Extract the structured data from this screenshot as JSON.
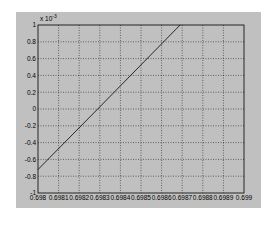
{
  "chart_data": {
    "type": "line",
    "title": "",
    "xlabel": "",
    "ylabel": "",
    "y_scale_label": "x 10^-3",
    "y_multiplier": 0.001,
    "xlim": [
      0.698,
      0.699
    ],
    "ylim": [
      -1,
      1
    ],
    "grid": true,
    "legend": null,
    "x_ticks": [
      "0.698",
      "0.6981",
      "0.6982",
      "0.6983",
      "0.6984",
      "0.6985",
      "0.6986",
      "0.6987",
      "0.6988",
      "0.6989",
      "0.699"
    ],
    "y_ticks": [
      "-1",
      "-0.8",
      "-0.6",
      "-0.4",
      "-0.2",
      "0",
      "0.2",
      "0.4",
      "0.6",
      "0.8",
      "1"
    ],
    "series": [
      {
        "name": "line",
        "color": "#000000",
        "x": [
          0.698,
          0.69829,
          0.69869
        ],
        "y": [
          -0.72,
          0.0,
          1.0
        ]
      }
    ]
  },
  "colors": {
    "figure_bg": "#c0c0c0",
    "axes_bg": "#ffffff",
    "grid": "#000000",
    "line": "#000000"
  }
}
